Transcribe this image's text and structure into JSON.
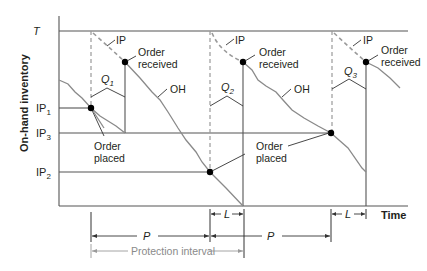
{
  "diagram": {
    "y_axis_label": "On-hand inventory",
    "x_axis_label": "Time",
    "target_label": "T",
    "ip_levels": {
      "ip1": {
        "base": "IP",
        "sub": "1"
      },
      "ip2": {
        "base": "IP",
        "sub": "2"
      },
      "ip3": {
        "base": "IP",
        "sub": "3"
      }
    },
    "quantities": [
      {
        "base": "Q",
        "sub": "1"
      },
      {
        "base": "Q",
        "sub": "2"
      },
      {
        "base": "Q",
        "sub": "3"
      }
    ],
    "curve_labels": {
      "ip": "IP",
      "oh": "OH"
    },
    "annotations": {
      "order_received_1": "Order",
      "order_received_2": "received",
      "order_placed_1": "Order",
      "order_placed_2": "placed"
    },
    "intervals": {
      "review_period": "P",
      "lead_time": "L",
      "protection_interval": "Protection interval"
    },
    "colors": {
      "axis": "#555555",
      "on_hand_curve": "#8a8a8a",
      "inventory_position_dash": "#9a9a9a",
      "dot": "#000000",
      "protection_interval": "#8a8a8a"
    }
  }
}
